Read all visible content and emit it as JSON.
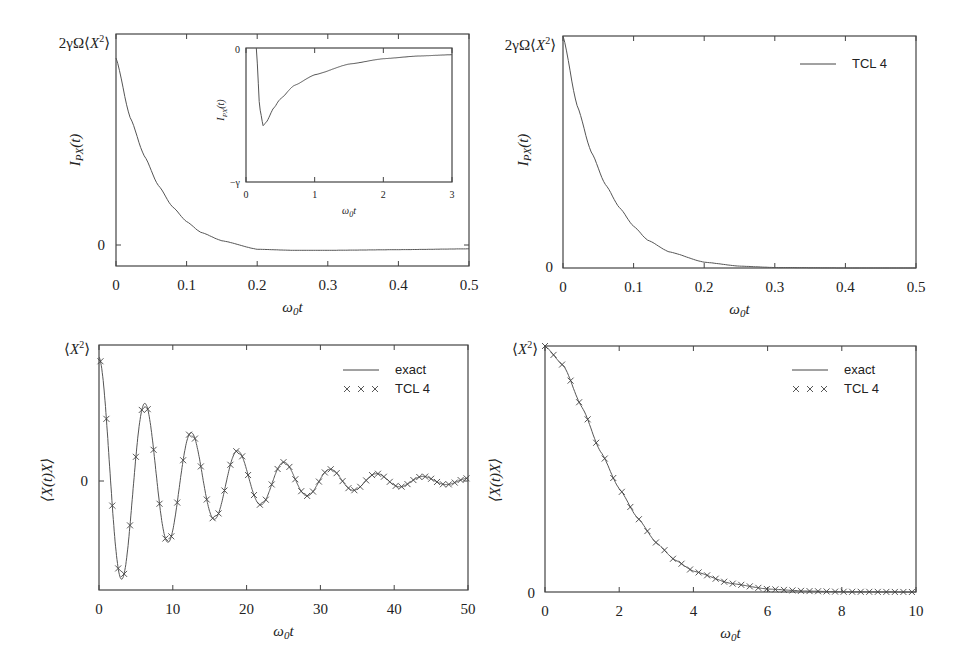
{
  "chart_data": [
    {
      "id": "top-left",
      "type": "line",
      "title": "",
      "xlabel": "ω0t",
      "ylabel": "I_PX(t)",
      "xlim": [
        0,
        0.5
      ],
      "x_ticks": [
        "0",
        "0.1",
        "0.2",
        "0.3",
        "0.4",
        "0.5"
      ],
      "y_tick_labels": [
        {
          "value": 1,
          "label": "2γΩ⟨X²⟩"
        },
        {
          "value": 0,
          "label": "0"
        }
      ],
      "ylim": [
        -0.1,
        1.05
      ],
      "grid": false,
      "series": [
        {
          "name": "I_PX(t)",
          "x": [
            0,
            0.02,
            0.04,
            0.06,
            0.08,
            0.1,
            0.12,
            0.15,
            0.2,
            0.25,
            0.3,
            0.4,
            0.5
          ],
          "y": [
            0.88,
            0.6,
            0.42,
            0.28,
            0.18,
            0.11,
            0.06,
            0.02,
            -0.02,
            -0.025,
            -0.025,
            -0.022,
            -0.018
          ]
        }
      ],
      "inset": {
        "xlabel": "ω0t",
        "ylabel": "I_PX(t)",
        "xlim": [
          0,
          3
        ],
        "x_ticks": [
          "0",
          "1",
          "2",
          "3"
        ],
        "y_tick_labels": [
          {
            "value": 0,
            "label": "0"
          },
          {
            "value": -1,
            "label": "−γ"
          }
        ],
        "series": [
          {
            "name": "I_PX(t)",
            "x": [
              0.15,
              0.2,
              0.25,
              0.3,
              0.4,
              0.5,
              0.7,
              1.0,
              1.5,
              2.0,
              2.5,
              3.0
            ],
            "y": [
              0.0,
              -0.45,
              -0.58,
              -0.55,
              -0.45,
              -0.38,
              -0.28,
              -0.2,
              -0.12,
              -0.08,
              -0.06,
              -0.05
            ]
          }
        ]
      }
    },
    {
      "id": "top-right",
      "type": "line",
      "xlabel": "ω0t",
      "ylabel": "I_PX(t)",
      "xlim": [
        0,
        0.5
      ],
      "x_ticks": [
        "0",
        "0.1",
        "0.2",
        "0.3",
        "0.4",
        "0.5"
      ],
      "y_tick_labels": [
        {
          "value": 1,
          "label": "2γΩ⟨X²⟩"
        },
        {
          "value": 0,
          "label": "0"
        }
      ],
      "ylim": [
        0,
        1
      ],
      "legend": {
        "position": "upper right",
        "entries": [
          {
            "label": "TCL 4",
            "style": "line"
          }
        ]
      },
      "series": [
        {
          "name": "TCL 4",
          "x": [
            0,
            0.02,
            0.04,
            0.06,
            0.08,
            0.1,
            0.12,
            0.15,
            0.2,
            0.25,
            0.3,
            0.4,
            0.5
          ],
          "y": [
            1.0,
            0.7,
            0.5,
            0.36,
            0.26,
            0.18,
            0.12,
            0.07,
            0.025,
            0.008,
            0.002,
            0.0,
            0.0
          ]
        }
      ]
    },
    {
      "id": "bottom-left",
      "type": "line",
      "xlabel": "ω0t",
      "ylabel": "⟨X(t)X⟩",
      "xlim": [
        0,
        50
      ],
      "x_ticks": [
        "0",
        "10",
        "20",
        "30",
        "40",
        "50"
      ],
      "y_tick_labels": [
        {
          "value": 1,
          "label": "⟨X²⟩"
        },
        {
          "value": 0,
          "label": "0"
        }
      ],
      "ylim": [
        -0.85,
        1.05
      ],
      "legend": {
        "position": "upper right",
        "entries": [
          {
            "label": "exact",
            "style": "line"
          },
          {
            "label": "TCL 4",
            "style": "x-markers"
          }
        ]
      },
      "series": [
        {
          "name": "exact",
          "model": "damped cosine",
          "amplitude": 1.0,
          "omega": 1.0,
          "decay_rate": 0.075,
          "period_approx": 6.3,
          "peaks": [
            [
              0,
              1.0
            ],
            [
              3.1,
              -0.83
            ],
            [
              6.3,
              0.61
            ],
            [
              9.4,
              -0.43
            ],
            [
              12.6,
              0.32
            ],
            [
              15.7,
              -0.24
            ],
            [
              18.9,
              0.18
            ],
            [
              22.0,
              -0.13
            ],
            [
              25.1,
              0.1
            ],
            [
              28.3,
              -0.07
            ],
            [
              31.4,
              0.05
            ],
            [
              34.6,
              -0.04
            ],
            [
              37.7,
              0.03
            ],
            [
              50,
              0.0
            ]
          ]
        },
        {
          "name": "TCL 4",
          "marker": "x",
          "marker_spacing": 0.8,
          "matches": "exact"
        }
      ]
    },
    {
      "id": "bottom-right",
      "type": "line",
      "xlabel": "ω0t",
      "ylabel": "⟨X(t)X⟩",
      "xlim": [
        0,
        10
      ],
      "x_ticks": [
        "0",
        "2",
        "4",
        "6",
        "8",
        "10"
      ],
      "y_tick_labels": [
        {
          "value": 1,
          "label": "⟨X²⟩"
        },
        {
          "value": 0,
          "label": "0"
        }
      ],
      "ylim": [
        0,
        1
      ],
      "legend": {
        "position": "upper right",
        "entries": [
          {
            "label": "exact",
            "style": "line"
          },
          {
            "label": "TCL 4",
            "style": "x-markers"
          }
        ]
      },
      "series": [
        {
          "name": "exact",
          "x": [
            0,
            0.5,
            1,
            1.5,
            2,
            2.5,
            3,
            3.5,
            4,
            5,
            6,
            7,
            8,
            10
          ],
          "y": [
            1.0,
            0.92,
            0.75,
            0.57,
            0.42,
            0.3,
            0.2,
            0.13,
            0.085,
            0.035,
            0.012,
            0.004,
            0.001,
            0.0
          ]
        },
        {
          "name": "TCL 4",
          "marker": "x",
          "marker_spacing": 0.23,
          "matches": "exact"
        }
      ]
    }
  ]
}
